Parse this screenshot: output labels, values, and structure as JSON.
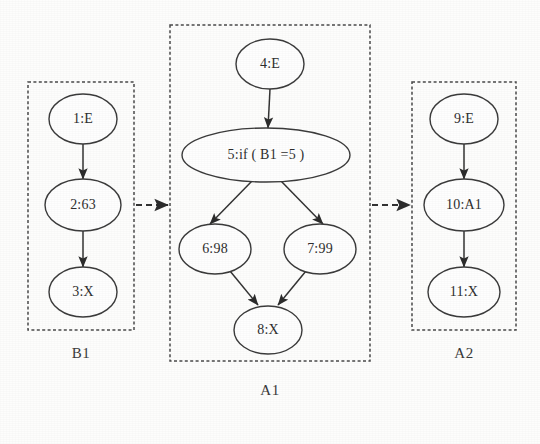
{
  "diagram": {
    "background_color": "#fdfdfc",
    "node_stroke_color": "#3b3b3b",
    "box_stroke_color": "#4a4a4a",
    "edge_color": "#333333"
  },
  "groups": [
    {
      "id": "B1",
      "caption": "B1",
      "box": {
        "x": 28,
        "y": 82,
        "width": 106,
        "height": 248
      },
      "caption_pos": {
        "x": 81,
        "y": 355
      }
    },
    {
      "id": "A1",
      "caption": "A1",
      "box": {
        "x": 170,
        "y": 25,
        "width": 200,
        "height": 336
      },
      "caption_pos": {
        "x": 270,
        "y": 392
      }
    },
    {
      "id": "A2",
      "caption": "A2",
      "box": {
        "x": 412,
        "y": 82,
        "width": 104,
        "height": 248
      },
      "caption_pos": {
        "x": 464,
        "y": 355
      }
    }
  ],
  "nodes": [
    {
      "id": "n1",
      "label": "1:E",
      "group": "B1",
      "cx": 83,
      "cy": 119,
      "rx": 34,
      "ry": 25,
      "size": "normal"
    },
    {
      "id": "n2",
      "label": "2:63",
      "group": "B1",
      "cx": 83,
      "cy": 205,
      "rx": 38,
      "ry": 26,
      "size": "normal"
    },
    {
      "id": "n3",
      "label": "3:X",
      "group": "B1",
      "cx": 83,
      "cy": 292,
      "rx": 34,
      "ry": 25,
      "size": "normal"
    },
    {
      "id": "n4",
      "label": "4:E",
      "group": "A1",
      "cx": 270,
      "cy": 64,
      "rx": 34,
      "ry": 25,
      "size": "normal"
    },
    {
      "id": "n5",
      "label": "5:if ( B1 =5 )",
      "group": "A1",
      "cx": 266,
      "cy": 155,
      "rx": 84,
      "ry": 27,
      "size": "cond"
    },
    {
      "id": "n6",
      "label": "6:98",
      "group": "A1",
      "cx": 215,
      "cy": 249,
      "rx": 36,
      "ry": 25,
      "size": "normal"
    },
    {
      "id": "n7",
      "label": "7:99",
      "group": "A1",
      "cx": 320,
      "cy": 249,
      "rx": 36,
      "ry": 25,
      "size": "normal"
    },
    {
      "id": "n8",
      "label": "8:X",
      "group": "A1",
      "cx": 268,
      "cy": 330,
      "rx": 34,
      "ry": 24,
      "size": "normal"
    },
    {
      "id": "n9",
      "label": "9:E",
      "group": "A2",
      "cx": 464,
      "cy": 119,
      "rx": 34,
      "ry": 25,
      "size": "normal"
    },
    {
      "id": "n10",
      "label": "10:A1",
      "group": "A2",
      "cx": 464,
      "cy": 205,
      "rx": 40,
      "ry": 26,
      "size": "normal"
    },
    {
      "id": "n11",
      "label": "11:X",
      "group": "A2",
      "cx": 464,
      "cy": 292,
      "rx": 36,
      "ry": 25,
      "size": "normal"
    }
  ],
  "edges": [
    {
      "id": "e1",
      "from": "n1",
      "to": "n2",
      "style": "solid",
      "x1": 83,
      "y1": 144,
      "x2": 83,
      "y2": 179
    },
    {
      "id": "e2",
      "from": "n2",
      "to": "n3",
      "style": "solid",
      "x1": 83,
      "y1": 231,
      "x2": 83,
      "y2": 267
    },
    {
      "id": "e3",
      "from": "n4",
      "to": "n5",
      "style": "solid",
      "x1": 270,
      "y1": 89,
      "x2": 268,
      "y2": 128
    },
    {
      "id": "e4",
      "from": "n5",
      "to": "n6",
      "style": "solid",
      "x1": 252,
      "y1": 181,
      "x2": 210,
      "y2": 224
    },
    {
      "id": "e5",
      "from": "n5",
      "to": "n7",
      "style": "solid",
      "x1": 281,
      "y1": 181,
      "x2": 323,
      "y2": 224
    },
    {
      "id": "e6",
      "from": "n6",
      "to": "n8",
      "style": "solid",
      "x1": 230,
      "y1": 271,
      "x2": 258,
      "y2": 305
    },
    {
      "id": "e7",
      "from": "n7",
      "to": "n8",
      "style": "solid",
      "x1": 306,
      "y1": 271,
      "x2": 278,
      "y2": 305
    },
    {
      "id": "e8",
      "from": "n9",
      "to": "n10",
      "style": "solid",
      "x1": 464,
      "y1": 144,
      "x2": 464,
      "y2": 179
    },
    {
      "id": "e9",
      "from": "n10",
      "to": "n11",
      "style": "solid",
      "x1": 464,
      "y1": 231,
      "x2": 464,
      "y2": 267
    },
    {
      "id": "e10",
      "from": "B1",
      "to": "A1",
      "style": "dashed",
      "x1": 136,
      "y1": 205,
      "x2": 168,
      "y2": 205
    },
    {
      "id": "e11",
      "from": "A1",
      "to": "A2",
      "style": "dashed",
      "x1": 372,
      "y1": 205,
      "x2": 410,
      "y2": 205
    }
  ]
}
